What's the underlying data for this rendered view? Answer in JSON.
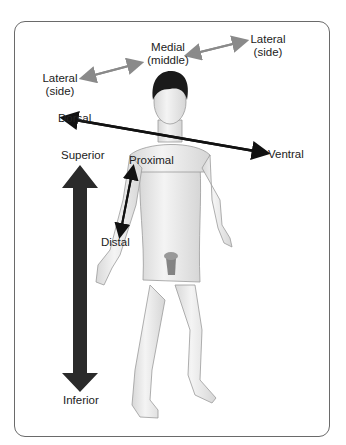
{
  "diagram": {
    "labels": {
      "medial": "Medial",
      "medial_sub": "(middle)",
      "lateral_left": "Lateral",
      "lateral_left_sub": "(side)",
      "lateral_right": "Lateral",
      "lateral_right_sub": "(side)",
      "dorsal": "Dorsal",
      "ventral": "Ventral",
      "superior": "Superior",
      "inferior": "Inferior",
      "proximal": "Proximal",
      "distal": "Distal"
    },
    "colors": {
      "frame": "#6a6a6a",
      "gray_arrow": "#8a8a8a",
      "black_arrow": "#111111",
      "big_arrow": "#2a2a2a",
      "hair": "#1a1a1a",
      "skin": "#ececec"
    }
  }
}
